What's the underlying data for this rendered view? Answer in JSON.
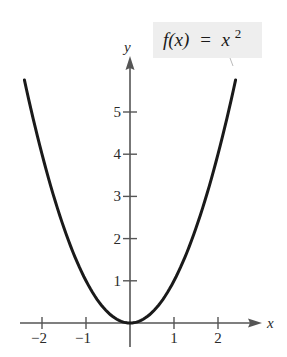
{
  "chart_data": {
    "type": "line",
    "title": "",
    "function_label": "f(x) = x^2",
    "xlabel": "x",
    "ylabel": "y",
    "xlim": [
      -2.5,
      3
    ],
    "ylim": [
      0,
      6
    ],
    "x_ticks": [
      -2,
      -1,
      1,
      2
    ],
    "x_tick_labels": [
      "−2",
      "−1",
      "1",
      "2"
    ],
    "y_ticks": [
      1,
      2,
      3,
      4,
      5
    ],
    "y_tick_labels": [
      "1",
      "2",
      "3",
      "4",
      "5"
    ],
    "grid": false,
    "series": [
      {
        "name": "f(x) = x^2",
        "x": [
          -2.4,
          -2,
          -1.5,
          -1,
          -0.5,
          0,
          0.5,
          1,
          1.5,
          2,
          2.4
        ],
        "values": [
          5.76,
          4,
          2.25,
          1,
          0.25,
          0,
          0.25,
          1,
          2.25,
          4,
          5.76
        ]
      }
    ],
    "annotation": {
      "text_func": "f(x)",
      "text_eq": "=",
      "text_rhs": "x",
      "text_exp": "2",
      "box_color": "#eeeeee"
    },
    "colors": {
      "curve": "#1a1a1a",
      "axis": "#555555"
    }
  }
}
